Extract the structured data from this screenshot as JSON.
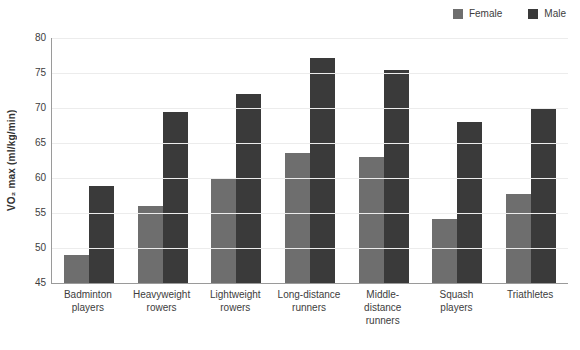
{
  "chart_data": {
    "type": "bar",
    "title": "",
    "xlabel": "",
    "ylabel": "VO₂ max (ml/kg/min)",
    "ylim": [
      45,
      80
    ],
    "ytick_step": 5,
    "yticks": [
      80,
      75,
      70,
      65,
      60,
      55,
      50,
      45
    ],
    "grid": true,
    "legend_position": "top-right",
    "categories": [
      "Badminton players",
      "Heavyweight rowers",
      "Lightweight rowers",
      "Long-distance runners",
      "Middle-distance runners",
      "Squash players",
      "Triathletes"
    ],
    "category_lines": [
      [
        "Badminton",
        "players"
      ],
      [
        "Heavyweight",
        "rowers"
      ],
      [
        "Lightweight",
        "rowers"
      ],
      [
        "Long-distance",
        "runners"
      ],
      [
        "Middle-",
        "distance",
        "runners"
      ],
      [
        "Squash",
        "players"
      ],
      [
        "Triathletes"
      ]
    ],
    "series": [
      {
        "name": "Female",
        "color": "#6e6e6e",
        "values": [
          49.0,
          56.0,
          60.0,
          63.6,
          63.0,
          54.2,
          57.7
        ]
      },
      {
        "name": "Male",
        "color": "#3a3a3a",
        "values": [
          58.9,
          69.5,
          72.0,
          77.2,
          75.4,
          68.0,
          69.8
        ]
      }
    ]
  },
  "legend": {
    "items": [
      {
        "label": "Female",
        "color": "#6e6e6e"
      },
      {
        "label": "Male",
        "color": "#3a3a3a"
      }
    ]
  },
  "colors": {
    "female": "#6e6e6e",
    "male": "#3a3a3a",
    "axis": "#9a9a9a",
    "grid": "#ececec",
    "text": "#3d3d3d",
    "background": "#ffffff"
  }
}
